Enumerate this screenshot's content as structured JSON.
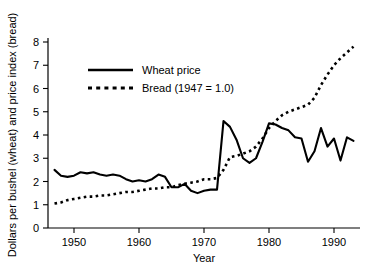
{
  "chart_data": {
    "type": "line",
    "title": "",
    "xlabel": "Year",
    "ylabel": "Dollars per bushel (wheat) and price index (bread)",
    "xlim": [
      1946,
      1994
    ],
    "ylim": [
      0,
      8.4
    ],
    "grid": false,
    "legend_position": "upper-left-inside",
    "xticks": [
      1950,
      1960,
      1970,
      1980,
      1990
    ],
    "xtick_labels": [
      "1950",
      "1960",
      "1970",
      "1980",
      "1990"
    ],
    "yticks": [
      0,
      1,
      2,
      3,
      4,
      5,
      6,
      7,
      8
    ],
    "ytick_labels": [
      "0",
      "1",
      "2",
      "3",
      "4",
      "5",
      "6",
      "7",
      "8"
    ],
    "series": [
      {
        "name": "Wheat price",
        "style": "solid",
        "color": "#000000",
        "x": [
          1947,
          1948,
          1949,
          1950,
          1951,
          1952,
          1953,
          1954,
          1955,
          1956,
          1957,
          1958,
          1959,
          1960,
          1961,
          1962,
          1963,
          1964,
          1965,
          1966,
          1967,
          1968,
          1969,
          1970,
          1971,
          1972,
          1973,
          1974,
          1975,
          1976,
          1977,
          1978,
          1979,
          1980,
          1981,
          1982,
          1983,
          1984,
          1985,
          1986,
          1987,
          1988,
          1989,
          1990,
          1991,
          1992,
          1993
        ],
        "values": [
          2.5,
          2.25,
          2.2,
          2.25,
          2.4,
          2.35,
          2.4,
          2.3,
          2.25,
          2.3,
          2.25,
          2.1,
          2.0,
          2.05,
          2.0,
          2.1,
          2.3,
          2.2,
          1.75,
          1.75,
          1.9,
          1.6,
          1.5,
          1.6,
          1.65,
          1.65,
          4.6,
          4.35,
          3.8,
          3.0,
          2.8,
          3.0,
          3.7,
          4.5,
          4.45,
          4.3,
          4.2,
          3.9,
          3.85,
          2.85,
          3.3,
          4.3,
          3.5,
          3.85,
          2.9,
          3.9,
          3.75
        ]
      },
      {
        "name": "Bread (1947 = 1.0)",
        "style": "dotted",
        "color": "#000000",
        "x": [
          1947,
          1948,
          1949,
          1950,
          1951,
          1952,
          1953,
          1954,
          1955,
          1956,
          1957,
          1958,
          1959,
          1960,
          1961,
          1962,
          1963,
          1964,
          1965,
          1966,
          1967,
          1968,
          1969,
          1970,
          1971,
          1972,
          1973,
          1974,
          1975,
          1976,
          1977,
          1978,
          1979,
          1980,
          1981,
          1982,
          1983,
          1984,
          1985,
          1986,
          1987,
          1988,
          1989,
          1990,
          1991,
          1992,
          1993
        ],
        "values": [
          1.05,
          1.1,
          1.2,
          1.25,
          1.3,
          1.35,
          1.35,
          1.4,
          1.4,
          1.45,
          1.5,
          1.55,
          1.55,
          1.6,
          1.65,
          1.7,
          1.7,
          1.75,
          1.75,
          1.85,
          1.9,
          1.95,
          2.0,
          2.1,
          2.1,
          2.15,
          2.5,
          3.05,
          3.1,
          3.2,
          3.3,
          3.5,
          3.85,
          4.3,
          4.6,
          4.85,
          5.0,
          5.1,
          5.2,
          5.3,
          5.6,
          6.15,
          6.6,
          7.0,
          7.3,
          7.55,
          7.8
        ]
      }
    ],
    "legend_entries": [
      {
        "label": "Wheat price",
        "style": "solid"
      },
      {
        "label": "Bread (1947 = 1.0)",
        "style": "dotted"
      }
    ]
  }
}
